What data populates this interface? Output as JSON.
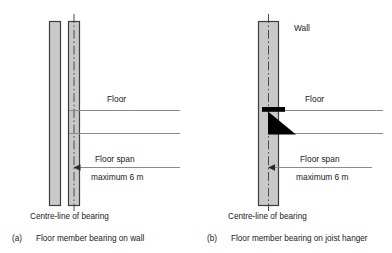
{
  "figure": {
    "background": "#ffffff",
    "line_color": "#8a8a8a",
    "wall_fill": "#c9c9c9",
    "wall_edge": "#3d3d3d",
    "centre_line_color": "#4a4a4a",
    "hanger_color": "#000000"
  },
  "panels": [
    {
      "id": "a",
      "index_label": "(a)",
      "caption": "Floor member bearing on wall",
      "centre_line_caption": "Centre-line of bearing",
      "labels": {
        "floor": "Floor",
        "floor_span": "Floor span",
        "maximum": "maximum 6 m"
      }
    },
    {
      "id": "b",
      "index_label": "(b)",
      "caption": "Floor member bearing on joist hanger",
      "centre_line_caption": "Centre-line of bearing",
      "labels": {
        "wall": "Wall",
        "floor": "Floor",
        "floor_span": "Floor span",
        "maximum": "maximum 6 m"
      }
    }
  ]
}
